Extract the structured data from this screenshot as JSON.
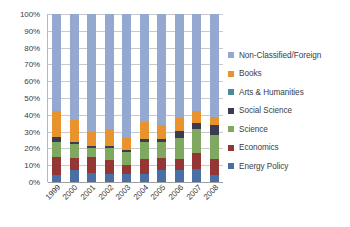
{
  "chart_data": {
    "type": "bar",
    "subtype": "stacked-100-percent",
    "title": "",
    "xlabel": "",
    "ylabel": "",
    "ylim": [
      0,
      100
    ],
    "ytick_labels": [
      "0%",
      "10%",
      "20%",
      "30%",
      "40%",
      "50%",
      "60%",
      "70%",
      "80%",
      "90%",
      "100%"
    ],
    "ytick_values": [
      0,
      10,
      20,
      30,
      40,
      50,
      60,
      70,
      80,
      90,
      100
    ],
    "grid": true,
    "legend_position": "right",
    "categories": [
      "1999",
      "2000",
      "2001",
      "2002",
      "2003",
      "2004",
      "2005",
      "2006",
      "2007",
      "2008"
    ],
    "series": [
      {
        "name": "Energy Policy",
        "color": "#4A6FA5",
        "values": [
          4.0,
          7.0,
          5.5,
          5.0,
          5.0,
          5.0,
          7.0,
          7.0,
          7.5,
          4.0
        ]
      },
      {
        "name": "Economics",
        "color": "#943634",
        "values": [
          11.0,
          7.5,
          9.5,
          8.0,
          5.0,
          8.5,
          7.5,
          7.0,
          10.0,
          9.5
        ]
      },
      {
        "name": "Science",
        "color": "#7FA860",
        "values": [
          9.0,
          8.0,
          5.0,
          7.5,
          8.0,
          10.5,
          9.5,
          12.5,
          14.0,
          14.5
        ]
      },
      {
        "name": "Social Science",
        "color": "#3B3B52",
        "values": [
          3.0,
          1.5,
          1.5,
          1.0,
          1.0,
          1.5,
          1.5,
          4.0,
          3.5,
          6.0
        ]
      },
      {
        "name": "Arts & Humanities",
        "color": "#4E8A96",
        "values": [
          0.0,
          0.0,
          0.0,
          0.0,
          0.0,
          0.0,
          0.0,
          0.0,
          0.0,
          0.0
        ]
      },
      {
        "name": "Books",
        "color": "#E8932E",
        "values": [
          15.0,
          13.0,
          8.0,
          10.0,
          7.5,
          10.0,
          8.5,
          7.5,
          7.0,
          5.0
        ]
      },
      {
        "name": "Non-Classified/Foreign",
        "color": "#95A9D0",
        "values": [
          58.0,
          63.0,
          70.5,
          68.5,
          73.5,
          64.5,
          66.0,
          62.0,
          58.0,
          61.0
        ]
      }
    ],
    "legend_entries": [
      {
        "label": "Non-Classified/Foreign",
        "color": "#95A9D0"
      },
      {
        "label": "Books",
        "color": "#E8932E"
      },
      {
        "label": "Arts & Humanities",
        "color": "#4E8A96"
      },
      {
        "label": "Social Science",
        "color": "#3B3B52"
      },
      {
        "label": "Science",
        "color": "#7FA860"
      },
      {
        "label": "Economics",
        "color": "#943634"
      },
      {
        "label": "Energy Policy",
        "color": "#4A6FA5"
      }
    ]
  }
}
